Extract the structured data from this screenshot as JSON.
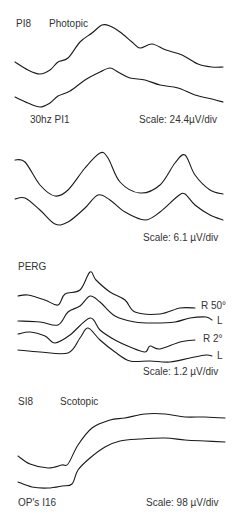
{
  "chart_data": [
    {
      "type": "line",
      "panel": "photopic",
      "labels": {
        "top_left": "PI8",
        "title": "Photopic",
        "bottom_left": "30hz PI1",
        "scale": "Scale: 24.4µV/div"
      },
      "series": [
        {
          "name": "trace-1",
          "points": [
            [
              15,
              62
            ],
            [
              28,
              70
            ],
            [
              40,
              74
            ],
            [
              50,
              70
            ],
            [
              58,
              62
            ],
            [
              68,
              58
            ],
            [
              80,
              42
            ],
            [
              92,
              33
            ],
            [
              102,
              25
            ],
            [
              110,
              26
            ],
            [
              120,
              32
            ],
            [
              132,
              42
            ],
            [
              140,
              48
            ],
            [
              152,
              44
            ],
            [
              166,
              50
            ],
            [
              182,
              55
            ],
            [
              198,
              64
            ],
            [
              212,
              67
            ],
            [
              223,
              67
            ]
          ]
        },
        {
          "name": "trace-2",
          "points": [
            [
              15,
              97
            ],
            [
              28,
              103
            ],
            [
              40,
              107
            ],
            [
              50,
              103
            ],
            [
              58,
              96
            ],
            [
              70,
              91
            ],
            [
              85,
              80
            ],
            [
              100,
              72
            ],
            [
              110,
              68
            ],
            [
              118,
              72
            ],
            [
              130,
              78
            ],
            [
              145,
              80
            ],
            [
              160,
              85
            ],
            [
              178,
              88
            ],
            [
              195,
              95
            ],
            [
              212,
              99
            ],
            [
              223,
              102
            ]
          ]
        }
      ]
    },
    {
      "type": "line",
      "panel": "flicker-30hz",
      "labels": {
        "scale": "Scale: 6.1 µV/div"
      },
      "series": [
        {
          "name": "trace-1",
          "points": [
            [
              15,
              160
            ],
            [
              25,
              162
            ],
            [
              40,
              185
            ],
            [
              55,
              196
            ],
            [
              68,
              190
            ],
            [
              85,
              168
            ],
            [
              100,
              153
            ],
            [
              108,
              158
            ],
            [
              120,
              182
            ],
            [
              140,
              193
            ],
            [
              160,
              185
            ],
            [
              175,
              163
            ],
            [
              185,
              155
            ],
            [
              195,
              175
            ],
            [
              210,
              190
            ],
            [
              223,
              194
            ]
          ]
        },
        {
          "name": "trace-2",
          "points": [
            [
              15,
              199
            ],
            [
              25,
              198
            ],
            [
              40,
              210
            ],
            [
              55,
              224
            ],
            [
              68,
              222
            ],
            [
              85,
              208
            ],
            [
              98,
              195
            ],
            [
              110,
              200
            ],
            [
              125,
              212
            ],
            [
              145,
              220
            ],
            [
              160,
              212
            ],
            [
              178,
              196
            ],
            [
              185,
              194
            ],
            [
              195,
              205
            ],
            [
              210,
              215
            ],
            [
              223,
              220
            ]
          ]
        }
      ]
    },
    {
      "type": "line",
      "panel": "PERG",
      "labels": {
        "title": "PERG",
        "scale": "Scale: 1.2 µV/div",
        "trace_labels": [
          "R 50°",
          "L",
          "R 2°",
          "L"
        ]
      },
      "series": [
        {
          "name": "R 50°",
          "points": [
            [
              18,
              296
            ],
            [
              28,
              295
            ],
            [
              45,
              300
            ],
            [
              58,
              305
            ],
            [
              65,
              294
            ],
            [
              80,
              290
            ],
            [
              90,
              272
            ],
            [
              96,
              280
            ],
            [
              110,
              292
            ],
            [
              125,
              300
            ],
            [
              135,
              312
            ],
            [
              160,
              314
            ],
            [
              180,
              308
            ],
            [
              195,
              308
            ]
          ]
        },
        {
          "name": "L",
          "points": [
            [
              18,
              321
            ],
            [
              40,
              322
            ],
            [
              58,
              325
            ],
            [
              68,
              312
            ],
            [
              80,
              306
            ],
            [
              90,
              296
            ],
            [
              100,
              302
            ],
            [
              115,
              316
            ],
            [
              135,
              322
            ],
            [
              155,
              323
            ],
            [
              175,
              322
            ],
            [
              190,
              318
            ],
            [
              206,
              317
            ],
            [
              212,
              320
            ]
          ]
        },
        {
          "name": "R 2°",
          "points": [
            [
              18,
              334
            ],
            [
              30,
              332
            ],
            [
              45,
              336
            ],
            [
              55,
              343
            ],
            [
              70,
              335
            ],
            [
              90,
              318
            ],
            [
              100,
              330
            ],
            [
              115,
              340
            ],
            [
              130,
              347
            ],
            [
              145,
              352
            ],
            [
              150,
              346
            ],
            [
              160,
              349
            ],
            [
              180,
              342
            ],
            [
              195,
              340
            ]
          ]
        },
        {
          "name": "L",
          "points": [
            [
              18,
              350
            ],
            [
              40,
              352
            ],
            [
              68,
              353
            ],
            [
              80,
              338
            ],
            [
              88,
              328
            ],
            [
              100,
              340
            ],
            [
              115,
              352
            ],
            [
              130,
              361
            ],
            [
              150,
              361
            ],
            [
              170,
              362
            ],
            [
              190,
              358
            ],
            [
              206,
              355
            ],
            [
              212,
              356
            ]
          ]
        }
      ]
    },
    {
      "type": "line",
      "panel": "scotopic",
      "labels": {
        "top_left": "SI8",
        "title": "Scotopic",
        "bottom_left": "OP's I16",
        "scale": "Scale: 98 µV/div"
      },
      "series": [
        {
          "name": "trace-1",
          "points": [
            [
              18,
              456
            ],
            [
              30,
              464
            ],
            [
              48,
              468
            ],
            [
              62,
              465
            ],
            [
              68,
              464
            ],
            [
              78,
              445
            ],
            [
              92,
              428
            ],
            [
              110,
              420
            ],
            [
              125,
              418
            ],
            [
              145,
              414
            ],
            [
              165,
              414
            ],
            [
              185,
              417
            ],
            [
              205,
              417
            ],
            [
              225,
              418
            ]
          ]
        },
        {
          "name": "trace-2",
          "points": [
            [
              18,
              482
            ],
            [
              32,
              487
            ],
            [
              48,
              488
            ],
            [
              62,
              486
            ],
            [
              72,
              484
            ],
            [
              78,
              470
            ],
            [
              90,
              458
            ],
            [
              105,
              447
            ],
            [
              120,
              441
            ],
            [
              140,
              439
            ],
            [
              165,
              438
            ],
            [
              185,
              440
            ],
            [
              205,
              441
            ],
            [
              225,
              442
            ]
          ]
        }
      ]
    }
  ],
  "panels": {
    "photopic": {
      "top_left": "PI8",
      "title": "Photopic",
      "bottom_left": "30hz PI1",
      "scale": "Scale: 24.4µV/div"
    },
    "flicker": {
      "scale": "Scale: 6.1 µV/div"
    },
    "perg": {
      "title": "PERG",
      "r50": "R 50°",
      "l1": "L",
      "r2": "R 2°",
      "l2": "L",
      "scale": "Scale: 1.2 µV/div"
    },
    "scotopic": {
      "top_left": "SI8",
      "title": "Scotopic",
      "bottom_left": "OP's I16",
      "scale": "Scale: 98 µV/div"
    }
  }
}
